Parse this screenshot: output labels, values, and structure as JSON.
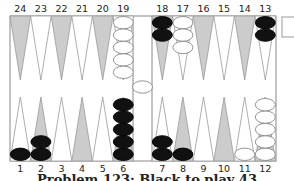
{
  "board": {
    "top_labels_left": [
      "24",
      "23",
      "22",
      "21",
      "20",
      "19"
    ],
    "top_labels_right": [
      "18",
      "17",
      "16",
      "15",
      "14",
      "13"
    ],
    "bottom_labels_left": [
      "1",
      "2",
      "3",
      "4",
      "5",
      "6"
    ],
    "bottom_labels_right": [
      "7",
      "8",
      "9",
      "10",
      "11",
      "12"
    ],
    "colors": {
      "frame": "#888888",
      "dark_point": "#cccccc",
      "light_point": "#ffffff",
      "black_checker": "#111111",
      "white_checker": "#ffffff"
    },
    "points": {
      "1": {
        "color": "black",
        "count": 1
      },
      "2": {
        "color": "black",
        "count": 2
      },
      "6": {
        "color": "black",
        "count": 5
      },
      "7": {
        "color": "black",
        "count": 2
      },
      "8": {
        "color": "black",
        "count": 1
      },
      "11": {
        "color": "white",
        "count": 1
      },
      "12": {
        "color": "white",
        "count": 5
      },
      "13": {
        "color": "black",
        "count": 2
      },
      "17": {
        "color": "white",
        "count": 3
      },
      "18": {
        "color": "black",
        "count": 2
      },
      "19": {
        "color": "white",
        "count": 5
      }
    },
    "bar": {
      "white": 1,
      "black": 0
    },
    "cube": {
      "value": ""
    }
  },
  "caption": "Problem 123: Black to play 43"
}
